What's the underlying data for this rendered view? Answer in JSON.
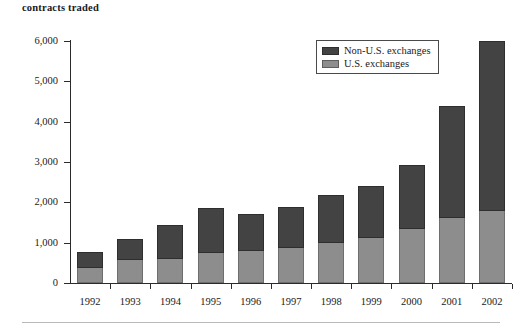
{
  "figure": {
    "title": "contracts traded",
    "legend": {
      "position": "top-right-inside",
      "items": [
        {
          "label": "Non-U.S. exchanges",
          "swatch": "dark-gray-swatch-icon",
          "color": "#434343"
        },
        {
          "label": "U.S. exchanges",
          "swatch": "light-gray-swatch-icon",
          "color": "#8d8d8d"
        }
      ]
    }
  },
  "chart_data": {
    "type": "bar",
    "subtype": "stacked",
    "title": "contracts traded",
    "xlabel": "",
    "ylabel": "",
    "ylim": [
      0,
      6000
    ],
    "ytick_values": [
      0,
      1000,
      2000,
      3000,
      4000,
      5000,
      6000
    ],
    "ytick_labels": [
      "0",
      "1,000",
      "2,000",
      "3,000",
      "4,000",
      "5,000",
      "6,000"
    ],
    "grid": false,
    "legend_position": "upper right",
    "categories": [
      "1992",
      "1993",
      "1994",
      "1995",
      "1996",
      "1997",
      "1998",
      "1999",
      "2000",
      "2001",
      "2002"
    ],
    "series": [
      {
        "name": "U.S. exchanges",
        "color": "#8d8d8d",
        "values": [
          375,
          575,
          600,
          750,
          800,
          875,
          1000,
          1120,
          1340,
          1620,
          1780
        ]
      },
      {
        "name": "Non-U.S. exchanges",
        "color": "#434343",
        "values": [
          400,
          505,
          830,
          1100,
          920,
          1005,
          1180,
          1290,
          1590,
          2780,
          4210
        ]
      }
    ],
    "totals": [
      775,
      1080,
      1430,
      1850,
      1720,
      1880,
      2180,
      2410,
      2930,
      4400,
      5990
    ]
  }
}
